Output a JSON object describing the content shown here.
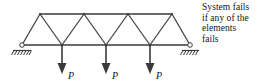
{
  "figure": {
    "type": "structural-truss-diagram",
    "width": 269,
    "height": 84,
    "background_color": "#ffffff",
    "line_color": "#3a3a3a",
    "text_color": "#141414"
  },
  "caption": {
    "lines": [
      "System fails",
      "if any of the",
      "elements",
      "fails"
    ]
  },
  "loads": [
    {
      "label": "P",
      "x": 62
    },
    {
      "label": "P",
      "x": 106
    },
    {
      "label": "P",
      "x": 150
    }
  ],
  "supports": {
    "left": {
      "kind": "pin-support",
      "x": 22,
      "y": 45
    },
    "right": {
      "kind": "roller-support",
      "x": 190,
      "y": 45
    }
  },
  "truss": {
    "bottom_chord": {
      "x1": 22,
      "x2": 190,
      "y": 45
    },
    "top_chord": {
      "x1": 40,
      "x2": 172,
      "y": 14
    },
    "top_nodes_x": [
      40,
      84,
      128,
      172
    ],
    "bottom_nodes_x": [
      22,
      62,
      106,
      150,
      190
    ]
  }
}
